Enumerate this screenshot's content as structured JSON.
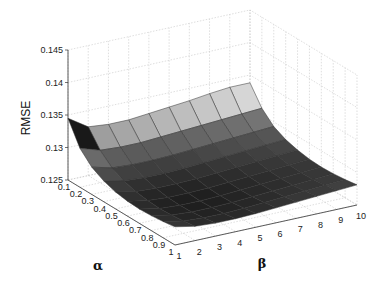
{
  "chart_data": {
    "type": "surface3d",
    "title": "",
    "xlabel": "β",
    "ylabel": "α",
    "zlabel": "RMSE",
    "x_ticks": [
      "1",
      "2",
      "3",
      "4",
      "5",
      "6",
      "7",
      "8",
      "9",
      "10"
    ],
    "y_ticks": [
      "0.1",
      "0.2",
      "0.3",
      "0.4",
      "0.5",
      "0.6",
      "0.7",
      "0.8",
      "0.9",
      "1"
    ],
    "z_ticks": [
      "0.125",
      "0.13",
      "0.135",
      "0.14",
      "0.145"
    ],
    "zlim": [
      0.125,
      0.145
    ],
    "grid": true,
    "colormap": "gray",
    "alpha": [
      0.1,
      0.2,
      0.3,
      0.4,
      0.5,
      0.6,
      0.7,
      0.8,
      0.9,
      1.0
    ],
    "beta": [
      1,
      2,
      3,
      4,
      5,
      6,
      7,
      8,
      9,
      10
    ],
    "rmse_note": "Surface is highest at alpha=0.1 (≈0.1345 at beta=1, ≈0.1335 at beta=10), dips to a minimum near alpha≈0.6-0.8, beta≈3-5 (≈0.1265), and rises slightly toward alpha=1.",
    "z": [
      [
        0.1345,
        0.1325,
        0.1322,
        0.1322,
        0.1325,
        0.1328,
        0.1331,
        0.1335,
        0.1338,
        0.1338
      ],
      [
        0.131,
        0.13,
        0.1298,
        0.1298,
        0.13,
        0.1302,
        0.1304,
        0.1306,
        0.1308,
        0.131
      ],
      [
        0.1292,
        0.1284,
        0.1282,
        0.1282,
        0.1283,
        0.1285,
        0.1287,
        0.1289,
        0.1291,
        0.1293
      ],
      [
        0.1282,
        0.1275,
        0.1273,
        0.1273,
        0.1274,
        0.1276,
        0.1278,
        0.128,
        0.1282,
        0.1284
      ],
      [
        0.1276,
        0.127,
        0.1268,
        0.1268,
        0.1269,
        0.1271,
        0.1273,
        0.1275,
        0.1277,
        0.1279
      ],
      [
        0.1273,
        0.1267,
        0.1265,
        0.1265,
        0.1266,
        0.1268,
        0.127,
        0.1272,
        0.1274,
        0.1276
      ],
      [
        0.1272,
        0.1266,
        0.1264,
        0.1264,
        0.1265,
        0.1267,
        0.1269,
        0.1271,
        0.1273,
        0.1275
      ],
      [
        0.1273,
        0.1267,
        0.1265,
        0.1265,
        0.1266,
        0.1268,
        0.127,
        0.1272,
        0.1274,
        0.1276
      ],
      [
        0.1275,
        0.1269,
        0.1267,
        0.1267,
        0.1268,
        0.127,
        0.1272,
        0.1274,
        0.1276,
        0.1278
      ],
      [
        0.1278,
        0.1272,
        0.127,
        0.127,
        0.1271,
        0.1273,
        0.1275,
        0.1277,
        0.1279,
        0.1281
      ]
    ]
  },
  "axes": {
    "zlabel": "RMSE",
    "alpha_label": "α",
    "beta_label": "β"
  }
}
